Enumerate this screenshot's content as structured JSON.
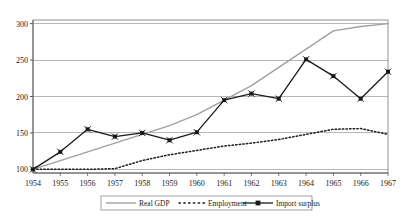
{
  "chart_data": {
    "type": "line",
    "title": "",
    "xlabel": "",
    "ylabel": "",
    "categories": [
      "1954",
      "1955",
      "1956",
      "1957",
      "1958",
      "1959",
      "1960",
      "1961",
      "1962",
      "1963",
      "1964",
      "1965",
      "1966",
      "1967"
    ],
    "xticklabels": [
      "1954",
      "1955",
      "1956",
      "1957",
      "1958",
      "1959",
      "1960",
      "1961",
      "1962",
      "1963",
      "1964",
      "1965",
      "1966",
      "1967"
    ],
    "yticklabels": [
      "100",
      "150",
      "200",
      "250",
      "300"
    ],
    "yticks": [
      100,
      150,
      200,
      250,
      300
    ],
    "ylim": [
      95,
      305
    ],
    "xlim": [
      1954,
      1967
    ],
    "grid": "horizontal",
    "legend_position": "bottom",
    "series": [
      {
        "name": "Real GDP",
        "style": "solid-gray",
        "color": "#a0a0a0",
        "marker": "none",
        "values": [
          100,
          112,
          124,
          136,
          148,
          160,
          175,
          195,
          215,
          240,
          265,
          290,
          296,
          300
        ]
      },
      {
        "name": "Employment",
        "style": "dotted",
        "color": "#1a1a1a",
        "marker": "none",
        "values": [
          100,
          100,
          100,
          101,
          112,
          120,
          126,
          132,
          136,
          141,
          148,
          155,
          156,
          148
        ]
      },
      {
        "name": "Import surplus",
        "style": "solid-marker",
        "color": "#1a1a1a",
        "marker": "square-x",
        "values": [
          100,
          124,
          155,
          145,
          150,
          140,
          151,
          195,
          204,
          197,
          251,
          228,
          197,
          234
        ]
      }
    ],
    "legend": [
      {
        "label": "Real GDP",
        "style": "solid-gray"
      },
      {
        "label": "Employment",
        "style": "dotted"
      },
      {
        "label": "Import surplus",
        "style": "solid-marker"
      }
    ]
  },
  "colors": {
    "gdp_line": "#a0a0a0",
    "employment_line": "#1a1a1a",
    "import_line": "#1a1a1a",
    "grid": "#999999",
    "axis": "#555555",
    "frame": "#777777",
    "background": "#ffffff"
  }
}
